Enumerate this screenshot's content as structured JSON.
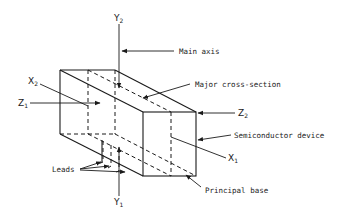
{
  "diagram": {
    "type": "isometric-technical-drawing",
    "axes": {
      "y2": {
        "letter": "Y",
        "sub": "2"
      },
      "y1": {
        "letter": "Y",
        "sub": "1"
      },
      "x2": {
        "letter": "X",
        "sub": "2"
      },
      "x1": {
        "letter": "X",
        "sub": "1"
      },
      "z1": {
        "letter": "Z",
        "sub": "1"
      },
      "z2": {
        "letter": "Z",
        "sub": "2"
      }
    },
    "callouts": {
      "main_axis": "Main axis",
      "major_cross_section": "Major cross-section",
      "semiconductor_device": "Semiconductor device",
      "principal_base": "Principal base",
      "leads": "Leads"
    },
    "colors": {
      "line": "#1a1a1a",
      "background": "#ffffff"
    }
  }
}
